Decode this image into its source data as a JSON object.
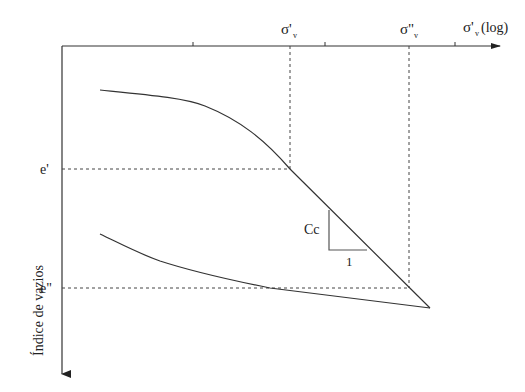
{
  "diagram": {
    "type": "consolidation curve (void ratio vs log effective stress)",
    "x_axis": {
      "label_main": "σ'",
      "label_sub": "v",
      "label_suffix": "(log)",
      "ticks_x": [
        193,
        325,
        455
      ]
    },
    "y_axis": {
      "label": "Índice de vazios"
    },
    "markers": {
      "sigma1_main": "σ'",
      "sigma1_sub": "v",
      "sigma2_main": "σ\"",
      "sigma2_sub": "v",
      "e1": "e'",
      "e2": "e\""
    },
    "slope_triangle": {
      "vertical_label": "Cc",
      "horizontal_label": "1"
    },
    "colors": {
      "line": "#333333",
      "dash": "#444444",
      "triangle": "#555555"
    }
  }
}
